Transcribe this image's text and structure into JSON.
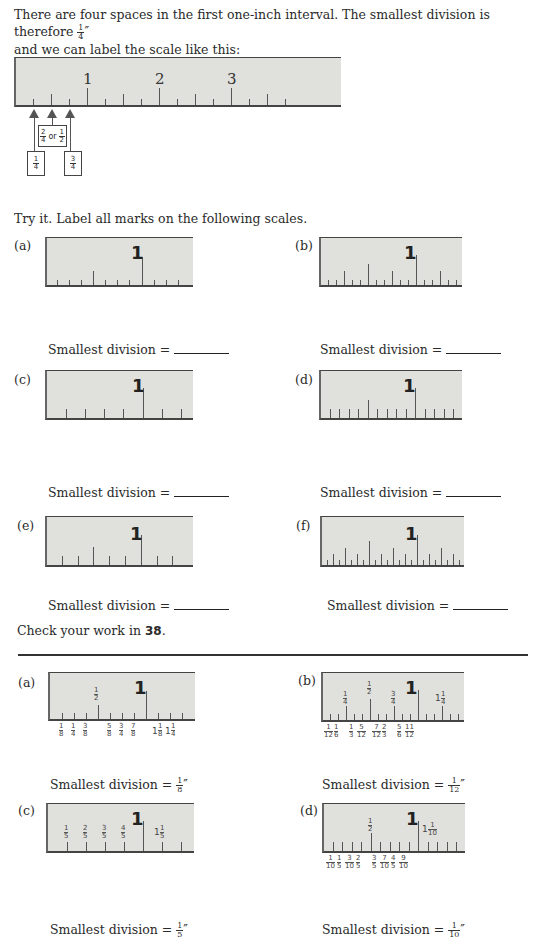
{
  "intro": {
    "line1": "There are four spaces in the first one-inch interval. The smallest division is therefore",
    "line1_fraction": {
      "num": "1",
      "den": "4",
      "unit": "″"
    },
    "line2": "and we can label the scale like this:"
  },
  "example_ruler": {
    "numbers": [
      "1",
      "2",
      "3"
    ],
    "callouts": {
      "one_quarter": {
        "num": "1",
        "den": "4"
      },
      "half": {
        "a_num": "2",
        "a_den": "4",
        "or": "or",
        "b_num": "1",
        "b_den": "2"
      },
      "three_quarters": {
        "num": "3",
        "den": "4"
      }
    }
  },
  "exercise": {
    "instruction": "Try it. Label all marks on the following scales.",
    "items": [
      {
        "letter": "(a)",
        "one": "1",
        "answer_label": "Smallest division ="
      },
      {
        "letter": "(b)",
        "one": "1",
        "answer_label": "Smallest division ="
      },
      {
        "letter": "(c)",
        "one": "1",
        "answer_label": "Smallest division ="
      },
      {
        "letter": "(d)",
        "one": "1",
        "answer_label": "Smallest division ="
      },
      {
        "letter": "(e)",
        "one": "1",
        "answer_label": "Smallest division ="
      },
      {
        "letter": "(f)",
        "one": "1",
        "answer_label": "Smallest division ="
      }
    ],
    "check_text": "Check your work in",
    "check_ref": "38",
    "check_end": "."
  },
  "answers": {
    "items": [
      {
        "letter": "(a)",
        "one": "1",
        "top_labels": [
          {
            "num": "1",
            "den": "2"
          }
        ],
        "bottom_labels": [
          "1/8",
          "1/4",
          "3/8",
          "5/8",
          "3/4",
          "7/8",
          "1 1/8",
          "1 1/4"
        ],
        "result_label": "Smallest division =",
        "result": {
          "num": "1",
          "den": "8",
          "unit": "″"
        }
      },
      {
        "letter": "(b)",
        "one": "1",
        "top_labels": [
          {
            "num": "1",
            "den": "4"
          },
          {
            "num": "1",
            "den": "2"
          },
          {
            "num": "3",
            "den": "4"
          },
          {
            "whole": "1",
            "num": "1",
            "den": "4"
          }
        ],
        "bottom_labels": [
          "1/12",
          "1/6",
          "1/3",
          "5/12",
          "7/12",
          "2/3",
          "5/6",
          "11/12"
        ],
        "result_label": "Smallest division =",
        "result": {
          "num": "1",
          "den": "12",
          "unit": "″"
        }
      },
      {
        "letter": "(c)",
        "one": "1",
        "top_labels": [
          {
            "num": "1",
            "den": "5"
          },
          {
            "num": "2",
            "den": "5"
          },
          {
            "num": "3",
            "den": "5"
          },
          {
            "num": "4",
            "den": "5"
          },
          {
            "whole": "1",
            "num": "1",
            "den": "5"
          }
        ],
        "bottom_labels": [],
        "result_label": "Smallest division =",
        "result": {
          "num": "1",
          "den": "5",
          "unit": "″"
        }
      },
      {
        "letter": "(d)",
        "one": "1",
        "top_labels": [
          {
            "num": "1",
            "den": "2"
          },
          {
            "whole": "1",
            "num": "1",
            "den": "10"
          }
        ],
        "bottom_labels": [
          "1/10",
          "1/5",
          "3/10",
          "2/5",
          "3/5",
          "7/10",
          "4/5",
          "9/10"
        ],
        "result_label": "Smallest division =",
        "result": {
          "num": "1",
          "den": "10",
          "unit": "″"
        }
      }
    ]
  }
}
